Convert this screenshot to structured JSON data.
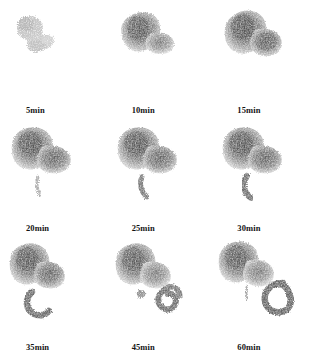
{
  "figure": {
    "type": "gastric-emptying-scintigraphy-series",
    "modality": "nuclear medicine planar scintigraphy",
    "background_color": "#ffffff",
    "tracer_color_dark": "#6a6a6a",
    "tracer_color_mid": "#9a9a9a",
    "tracer_color_faint": "#cfcfcf",
    "label_color": "#141414",
    "rows": 3,
    "columns": 3,
    "footnote": ""
  },
  "frames": [
    {
      "id": "frame-5min",
      "label": "5min",
      "row": 1,
      "column": 1,
      "stomach_intensity": "faint",
      "bowel_stage": "none",
      "description": "sparse diffuse tracer speckle, no defined organ outline"
    },
    {
      "id": "frame-10min",
      "label": "10min",
      "row": 1,
      "column": 2,
      "stomach_intensity": "moderate",
      "bowel_stage": "none",
      "description": "stomach fundus and body filled, comma shaped mass"
    },
    {
      "id": "frame-15min",
      "label": "15min",
      "row": 1,
      "column": 3,
      "stomach_intensity": "strong",
      "bowel_stage": "none",
      "description": "full stomach outline with antrum lobe, peak gastric activity"
    },
    {
      "id": "frame-20min",
      "label": "20min",
      "row": 2,
      "column": 1,
      "stomach_intensity": "strong",
      "bowel_stage": "thin-streak",
      "description": "stomach with faint thin duodenal streak below antrum"
    },
    {
      "id": "frame-25min",
      "label": "25min",
      "row": 2,
      "column": 2,
      "stomach_intensity": "strong",
      "bowel_stage": "short-curve",
      "description": "stomach plus short curved duodenal segment"
    },
    {
      "id": "frame-30min",
      "label": "30min",
      "row": 2,
      "column": 3,
      "stomach_intensity": "strong",
      "bowel_stage": "curve",
      "description": "stomach plus thicker curved duodenal sweep"
    },
    {
      "id": "frame-35min",
      "label": "35min",
      "row": 3,
      "column": 1,
      "stomach_intensity": "strong",
      "bowel_stage": "c-sweep",
      "description": "stomach plus prominent C shaped duodenal sweep"
    },
    {
      "id": "frame-45min",
      "label": "45min",
      "row": 3,
      "column": 2,
      "stomach_intensity": "moderate",
      "bowel_stage": "partial-loop",
      "description": "stomach with separate bowel focus and partial loop to the right"
    },
    {
      "id": "frame-60min",
      "label": "60min",
      "row": 3,
      "column": 3,
      "stomach_intensity": "moderate",
      "bowel_stage": "full-loop",
      "description": "stomach plus closed ring shaped bowel loop"
    }
  ]
}
